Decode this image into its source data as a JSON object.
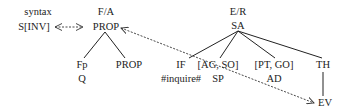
{
  "diagram": {
    "syntax": {
      "title": "syntax",
      "label": "S[INV]"
    },
    "fa": {
      "title": "F/A",
      "label": "PROP",
      "children": [
        {
          "top": "Fp",
          "bottom": "Q"
        },
        {
          "top": "PROP",
          "bottom": ""
        }
      ]
    },
    "er": {
      "title": "E/R",
      "label": "SA",
      "children": [
        {
          "top": "IF",
          "bottom": "#inquire#"
        },
        {
          "top": "[AG, SO]",
          "bottom": "SP"
        },
        {
          "top": "[PT, GO]",
          "bottom": "AD"
        },
        {
          "top": "TH",
          "bottom": "EV"
        }
      ]
    },
    "links": [
      {
        "from": "S[INV]",
        "to": "PROP",
        "style": "dashed-double-arrow"
      },
      {
        "from": "PROP",
        "to": "EV",
        "style": "dashed-double-arrow"
      }
    ]
  }
}
